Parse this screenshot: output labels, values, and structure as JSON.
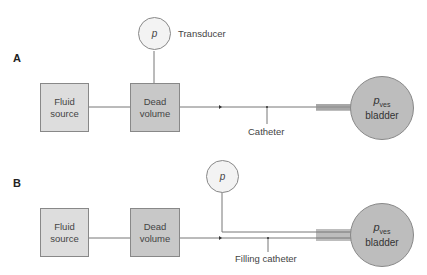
{
  "panels": [
    {
      "label": "A",
      "fluid_source": [
        "Fluid",
        "source"
      ],
      "dead_volume": [
        "Dead",
        "volume"
      ],
      "transducer_symbol": "p",
      "transducer_label": "Transducer",
      "catheter_label": "Catheter",
      "bladder_pressure": "p",
      "bladder_pressure_sub": "ves",
      "bladder_label": "bladder"
    },
    {
      "label": "B",
      "fluid_source": [
        "Fluid",
        "source"
      ],
      "dead_volume": [
        "Dead",
        "volume"
      ],
      "transducer_symbol": "p",
      "catheter_label": "Filling catheter",
      "bladder_pressure": "p",
      "bladder_pressure_sub": "ves",
      "bladder_label": "bladder"
    }
  ],
  "colors": {
    "box_fill": "#dddddd",
    "dead_volume_fill": "#c8c8c8",
    "transducer_fill": "#f3f3f3",
    "bladder_fill": "#bdbdbd",
    "line": "#777777"
  }
}
